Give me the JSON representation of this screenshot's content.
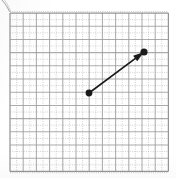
{
  "figure": {
    "media": "scanned-graph-paper",
    "width_px": 176,
    "height_px": 178
  },
  "grid": {
    "description": "Printed graph paper grid, light grey major rules with finer dotted minor rules",
    "origin_x_px": 10,
    "origin_y_px": 13,
    "major_spacing_px": 13.2,
    "major_columns": 12,
    "major_rows": 12,
    "minor_per_major": 2,
    "major_color": "#9a9a9a",
    "minor_color": "#c4c4c4",
    "border_color": "#8f8f8f",
    "background_color": "#ffffff"
  },
  "vector": {
    "label": "drawn vector arrow",
    "color": "#1a1a1a",
    "stroke_width_px": 1.6,
    "tail_point_px": {
      "x": 89,
      "y": 93
    },
    "head_point_px": {
      "x": 144,
      "y": 52
    },
    "tail_grid": {
      "col": 6,
      "row": 6
    },
    "head_grid": {
      "col": 10.2,
      "row": 3
    },
    "components_grid": {
      "dx": 4.2,
      "dy": 3.1
    },
    "tail_dot_radius_px": 3.4,
    "head_dot_radius_px": 3.6,
    "arrowhead_length_px": 11,
    "arrowhead_half_width_px": 3.4
  },
  "chart_data": {
    "type": "scatter",
    "title": "",
    "xlabel": "",
    "ylabel": "",
    "grid": true,
    "legend": null,
    "xlim": [
      0,
      12
    ],
    "ylim": [
      0,
      12
    ],
    "series": [
      {
        "name": "vector",
        "x": [
          6.0,
          10.2
        ],
        "y": [
          6.0,
          9.1
        ],
        "annotation": "arrow from (6, 6) to (10.2, 9.1)"
      }
    ]
  },
  "marks": {
    "corner_stroke": "stray ink stroke, upper-left corner"
  }
}
